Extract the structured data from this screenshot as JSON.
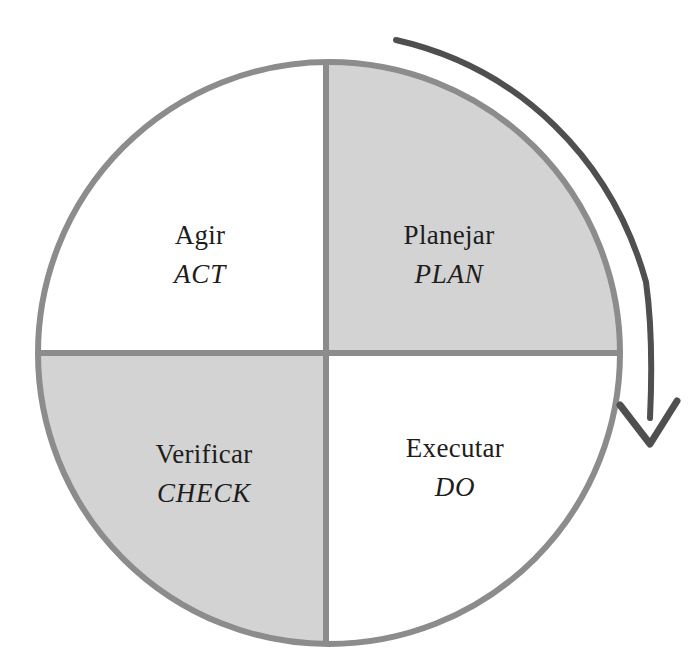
{
  "diagram": {
    "type": "pdca-cycle-wheel",
    "shape": "circle-four-quadrants",
    "background_color": "#ffffff",
    "circle": {
      "center_x": 329,
      "center_y": 353,
      "radius": 291,
      "stroke_color": "#8c8c8c",
      "stroke_width": 6,
      "white_fill": "#ffffff",
      "gray_fill": "#d3d3d3"
    },
    "divider": {
      "stroke_color": "#8c8c8c",
      "stroke_width": 6,
      "vertical_x": 324,
      "horizontal_y": 353
    },
    "arrow": {
      "name": "clockwise-cycle-arrow",
      "direction": "clockwise",
      "color": "#4f4f4f",
      "stroke_width": 6,
      "start_x": 396,
      "start_y": 40,
      "tip_x": 650,
      "tip_y": 444
    },
    "quadrants": [
      {
        "id": "plan",
        "position": "top-right",
        "fill": "gray",
        "label_pt": "Planejar",
        "label_en": "PLAN",
        "center_x": 449,
        "center_y": 255
      },
      {
        "id": "do",
        "position": "bottom-right",
        "fill": "white",
        "label_pt": "Executar",
        "label_en": "DO",
        "center_x": 455,
        "center_y": 468
      },
      {
        "id": "check",
        "position": "bottom-left",
        "fill": "gray",
        "label_pt": "Verificar",
        "label_en": "CHECK",
        "center_x": 204,
        "center_y": 474
      },
      {
        "id": "act",
        "position": "top-left",
        "fill": "white",
        "label_pt": "Agir",
        "label_en": "ACT",
        "center_x": 200,
        "center_y": 255
      }
    ]
  }
}
